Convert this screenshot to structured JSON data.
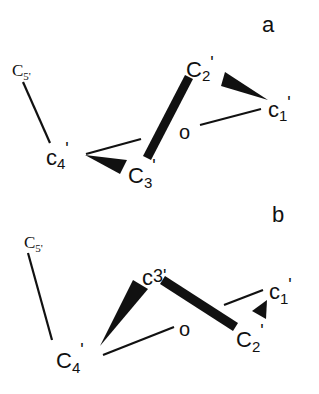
{
  "panels": [
    {
      "id": "a",
      "label": "a",
      "atoms": {
        "c5": {
          "main": "C",
          "sub": "5'"
        },
        "c4": {
          "main": "c",
          "sub": "4",
          "prime": "'"
        },
        "c3": {
          "main": "C",
          "sub": "3",
          "prime": "'"
        },
        "c2": {
          "main": "C",
          "sub": "2",
          "prime": "'"
        },
        "c1": {
          "main": "c",
          "sub": "1",
          "prime": "'"
        },
        "o": "o"
      }
    },
    {
      "id": "b",
      "label": "b",
      "atoms": {
        "c5": {
          "main": "C",
          "sub": "5'"
        },
        "c4": {
          "main": "C",
          "sub": "4",
          "prime": "'"
        },
        "c3": {
          "main": "c",
          "sub": "3'",
          "prime": ""
        },
        "c2": {
          "main": "C",
          "sub": "2",
          "prime": "'"
        },
        "c1": {
          "main": "c",
          "sub": "1",
          "prime": "'"
        },
        "o": "o"
      }
    }
  ],
  "colors": {
    "ink": "#111111",
    "background": "#ffffff"
  }
}
